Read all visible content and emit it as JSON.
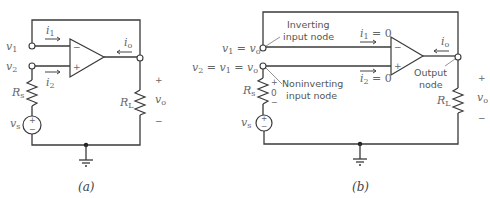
{
  "figure": {
    "panel_a": {
      "caption": "(a)",
      "labels": {
        "v1": "v",
        "v1_sub": "1",
        "v2": "v",
        "v2_sub": "2",
        "i1": "i",
        "i1_sub": "1",
        "i2": "i",
        "i2_sub": "2",
        "io": "i",
        "io_sub": "o",
        "Rs": "R",
        "Rs_sub": "s",
        "RL": "R",
        "RL_sub": "L",
        "vs": "v",
        "vs_sub": "s",
        "vo": "v",
        "vo_sub": "o",
        "plus": "+",
        "minus": "−",
        "opamp_minus": "−",
        "opamp_plus": "+",
        "src_plus": "+",
        "src_minus": "−"
      }
    },
    "panel_b": {
      "caption": "(b)",
      "labels": {
        "v1_eq": "v",
        "v1_eq_sub": "1",
        "v1_eq_rest": " = v",
        "v1_eq_rest_sub": "o",
        "v2_eq": "v",
        "v2_eq_sub": "2",
        "v2_eq_mid": " = v",
        "v2_eq_mid_sub": "1",
        "v2_eq_rest": " = v",
        "v2_eq_rest_sub": "o",
        "inverting_line1": "Inverting",
        "inverting_line2": "input node",
        "noninverting_line1": "Noninverting",
        "noninverting_line2": "input node",
        "i1_eq": "i",
        "i1_eq_sub": "1",
        "i1_eq_rest": " = 0",
        "i2_eq": "i",
        "i2_eq_sub": "2",
        "i2_eq_rest": " = 0",
        "io": "i",
        "io_sub": "o",
        "output_line1": "Output",
        "output_line2": "node",
        "Rs": "R",
        "Rs_sub": "s",
        "Rs_plus": "+",
        "Rs_zero": "0",
        "Rs_minus": "−",
        "RL": "R",
        "RL_sub": "L",
        "vs": "v",
        "vs_sub": "s",
        "vo": "v",
        "vo_sub": "o",
        "plus": "+",
        "minus": "−",
        "opamp_minus": "−",
        "opamp_plus": "+",
        "src_plus": "+",
        "src_minus": "−"
      }
    }
  }
}
